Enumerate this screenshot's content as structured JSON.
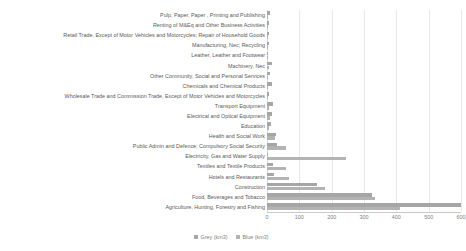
{
  "chart_data": {
    "type": "bar",
    "orientation": "horizontal",
    "title": "",
    "xlabel": "",
    "ylabel": "",
    "xlim": [
      0,
      600
    ],
    "xticks": [
      0,
      100,
      200,
      300,
      400,
      500,
      600
    ],
    "grid": true,
    "legend_position": "bottom",
    "categories": [
      "Pulp, Paper, Paper , Printing and Publishing",
      "Renting of M&Eq and Other Business Activities",
      "Retail Trade, Except of Motor Vehicles and Motorcycles; Repair of Household Goods",
      "Manufacturing, Nec; Recycling",
      "Leather, Leather and Footwear",
      "Machinery, Nec",
      "Other Community, Social and Personal Services",
      "Chemicals and Chemical Products",
      "Wholesale Trade and Commission Trade, Except of Motor Vehicles and Motorcycles",
      "Transport Equipment",
      "Electrical and Optical Equipment",
      "Education",
      "Health and Social Work",
      "Public Admin and Defence; Compulsory Social Security",
      "Electricity, Gas and Water Supply",
      "Textiles and Textile Products",
      "Hotels and Restaurants",
      "Construction",
      "Food, Beverages and Tobacco",
      "Agriculture, Hunting, Forestry and Fishing"
    ],
    "series": [
      {
        "name": "Grey (km3)",
        "color": "#a6a6a6",
        "values": [
          9,
          7,
          7,
          5,
          4,
          17,
          8,
          15,
          7,
          18,
          17,
          11,
          27,
          30,
          3,
          20,
          23,
          155,
          325,
          600
        ]
      },
      {
        "name": "Blue (km3)",
        "color": "#b3b3b3",
        "values": [
          4,
          3,
          3,
          4,
          4,
          6,
          3,
          4,
          3,
          5,
          8,
          5,
          25,
          58,
          245,
          60,
          67,
          180,
          335,
          410
        ]
      }
    ]
  },
  "legend": {
    "items": [
      {
        "label": "Grey (km3)",
        "color": "#a6a6a6"
      },
      {
        "label": "Blue (km3)",
        "color": "#b3b3b3"
      }
    ]
  }
}
